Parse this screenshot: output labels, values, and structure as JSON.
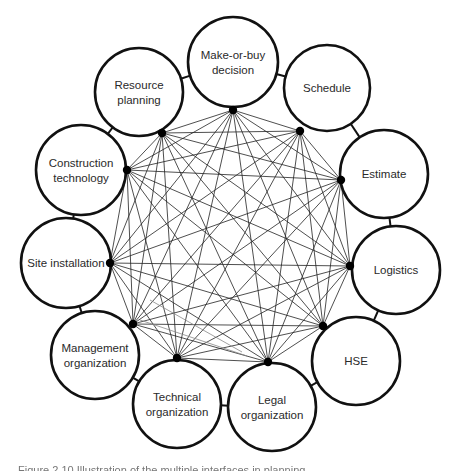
{
  "diagram": {
    "type": "fully-connected interface network",
    "stroke_color": "#111111",
    "line_color": "#222222",
    "faint_arrow_color": "#888888",
    "nodes": [
      {
        "id": "make-or-buy",
        "lines": [
          "Make-or-buy",
          "decision"
        ],
        "cx": 233,
        "cy": 62,
        "r": 45,
        "px": 233,
        "py": 110
      },
      {
        "id": "schedule",
        "lines": [
          "Schedule"
        ],
        "cx": 327,
        "cy": 88,
        "r": 43,
        "px": 300,
        "py": 131
      },
      {
        "id": "estimate",
        "lines": [
          "Estimate"
        ],
        "cx": 384,
        "cy": 174,
        "r": 44,
        "px": 341,
        "py": 180
      },
      {
        "id": "logistics",
        "lines": [
          "Logistics"
        ],
        "cx": 396,
        "cy": 270,
        "r": 44,
        "px": 350,
        "py": 266
      },
      {
        "id": "hse",
        "lines": [
          "HSE"
        ],
        "cx": 356,
        "cy": 361,
        "r": 44,
        "px": 323,
        "py": 326
      },
      {
        "id": "legal-organization",
        "lines": [
          "Legal",
          "organization"
        ],
        "cx": 272,
        "cy": 407,
        "r": 44,
        "px": 268,
        "py": 362
      },
      {
        "id": "technical-organization",
        "lines": [
          "Technical",
          "organization"
        ],
        "cx": 177,
        "cy": 404,
        "r": 44,
        "px": 177,
        "py": 358
      },
      {
        "id": "management-organization",
        "lines": [
          "Management",
          "organization"
        ],
        "cx": 95,
        "cy": 355,
        "r": 44,
        "px": 133,
        "py": 324
      },
      {
        "id": "site-installation",
        "lines": [
          "Site installation"
        ],
        "cx": 66,
        "cy": 263,
        "r": 45,
        "px": 110,
        "py": 263
      },
      {
        "id": "construction-technology",
        "lines": [
          "Construction",
          "technology"
        ],
        "cx": 81,
        "cy": 170,
        "r": 45,
        "px": 127,
        "py": 170
      },
      {
        "id": "resource-planning",
        "lines": [
          "Resource",
          "planning"
        ],
        "cx": 139,
        "cy": 92,
        "r": 44,
        "px": 162,
        "py": 133
      }
    ]
  },
  "caption": "Figure 2.10   Illustration of the multiple interfaces in planning"
}
